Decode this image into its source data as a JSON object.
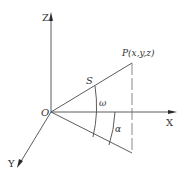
{
  "diagram": {
    "type": "3d-coordinate-geometry",
    "axes": {
      "z_label": "Z",
      "x_label": "X",
      "y_label": "Y",
      "origin_label": "O"
    },
    "point": {
      "label": "P(x,y,z)"
    },
    "segment_label": "S",
    "angles": {
      "omega": "ω",
      "alpha": "α"
    },
    "colors": {
      "line": "#4a4a4a",
      "text": "#333333",
      "background": "#ffffff"
    }
  }
}
